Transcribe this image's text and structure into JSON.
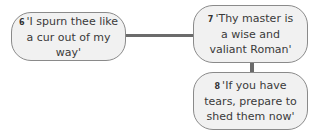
{
  "diagram": {
    "nodes": [
      {
        "id": "6",
        "number": "6",
        "text": "'I spurn thee like a cur out of my way'"
      },
      {
        "id": "7",
        "number": "7",
        "text": "'Thy master is a wise and valiant Roman'"
      },
      {
        "id": "8",
        "number": "8",
        "text": "'If you have tears, prepare to shed them now'"
      }
    ],
    "edges": [
      {
        "from": "6",
        "to": "7"
      },
      {
        "from": "7",
        "to": "8"
      }
    ],
    "colors": {
      "node_fill": "#f1f1f1",
      "node_border": "#8a8a8a",
      "connector": "#6b6b6b"
    }
  }
}
